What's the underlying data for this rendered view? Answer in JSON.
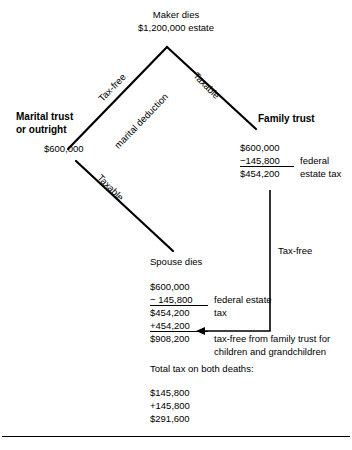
{
  "diagram": {
    "title_top": {
      "line1": "Maker dies",
      "line2": "$1,200,000 estate"
    },
    "branches": {
      "left_label_1": "Tax-free",
      "left_label_2": "marital deduction",
      "right_label": "Taxable",
      "second_left_label": "Taxable",
      "vertical_label": "Tax-free"
    },
    "marital": {
      "heading_line1": "Marital trust",
      "heading_line2": "or outright",
      "amount": "$600,000"
    },
    "family": {
      "heading": "Family trust",
      "rows": [
        {
          "num": "$600,000",
          "label": ""
        },
        {
          "num": "−145,800",
          "label": "federal"
        },
        {
          "num": "$454,200",
          "label": "estate tax"
        }
      ]
    },
    "spouse": {
      "heading": "Spouse dies",
      "rows": [
        {
          "num": "$600,000",
          "label": ""
        },
        {
          "num": "− 145,800",
          "label": "federal estate"
        },
        {
          "num": "$454,200",
          "label": "tax"
        },
        {
          "num": "+454,200",
          "label": ""
        },
        {
          "num": "$908,200",
          "label": "tax-free from family trust for"
        }
      ],
      "note_line2": "children and grandchildren"
    },
    "totals": {
      "label": "Total tax on both deaths:",
      "rows": [
        "$145,800",
        "+145,800",
        "$291,600"
      ]
    },
    "colors": {
      "ink": "#000000",
      "background": "#ffffff"
    }
  }
}
